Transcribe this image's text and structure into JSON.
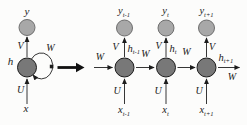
{
  "folded": {
    "output_label": "y",
    "hidden_label": "h",
    "input_label": "x",
    "v_weight": "V",
    "u_weight": "U",
    "w_weight": "W"
  },
  "unrolled": {
    "incoming_w": "W",
    "outgoing_w": "W",
    "columns": [
      {
        "y_main": "y",
        "y_sub": "t-1",
        "h_main": "h",
        "h_sub": "t-1",
        "x_main": "x",
        "x_sub": "t-1",
        "v": "V",
        "u": "U",
        "w_next": "W"
      },
      {
        "y_main": "y",
        "y_sub": "t",
        "h_main": "h",
        "h_sub": "t",
        "x_main": "x",
        "x_sub": "t",
        "v": "V",
        "u": "U",
        "w_next": "W"
      },
      {
        "y_main": "y",
        "y_sub": "t+1",
        "h_main": "h",
        "h_sub": "t+1",
        "x_main": "x",
        "x_sub": "t+1",
        "v": "V",
        "u": "U"
      }
    ]
  },
  "colors": {
    "output_node_fill": "#a8a8a8",
    "output_node_stroke": "#6f6f6f",
    "hidden_node_fill": "#787878",
    "hidden_node_stroke": "#1c1c1c",
    "edge": "#1f1f1f",
    "background": "#fcfcfb"
  }
}
